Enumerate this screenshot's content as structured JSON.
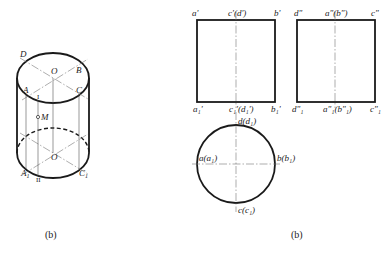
{
  "figure_left": {
    "caption": "(b)",
    "labels": {
      "D": "D",
      "B": "B",
      "O_top": "O",
      "A": "A",
      "C": "C",
      "I": "I",
      "M": "M",
      "O_bottom": "O",
      "A1": "A",
      "A1_sub": "1",
      "II": "II",
      "C1": "C",
      "C1_sub": "1"
    }
  },
  "figure_right": {
    "caption": "(b)",
    "front_view": {
      "top_left": "a'",
      "top_center": "c'(d')",
      "top_right": "b'",
      "bottom_left": "a₁'",
      "bottom_center": "c₁'(d₁')",
      "bottom_right": "b₁'"
    },
    "side_view": {
      "top_left": "d\"",
      "top_center": "a\"(b\")",
      "top_right": "c\"",
      "bottom_left": "d\"₁",
      "bottom_center": "a\"₁(b\"₁)",
      "bottom_right": "c\"₁"
    },
    "top_view": {
      "top": "d(d₁)",
      "left": "a(a₁)",
      "right": "b(b₁)",
      "bottom": "c(c₁)"
    }
  },
  "colors": {
    "line": "#1a1a1a",
    "thin_line": "#555555",
    "background": "#ffffff"
  }
}
